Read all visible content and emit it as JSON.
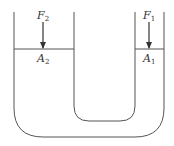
{
  "diagram": {
    "type": "hydraulic-press-u-tube",
    "colors": {
      "line": "#555555",
      "text": "#333333",
      "background": "#ffffff"
    },
    "left_piston": {
      "force_label": "F",
      "force_sub": "2",
      "area_label": "A",
      "area_sub": "2"
    },
    "right_piston": {
      "force_label": "F",
      "force_sub": "1",
      "area_label": "A",
      "area_sub": "1"
    }
  }
}
